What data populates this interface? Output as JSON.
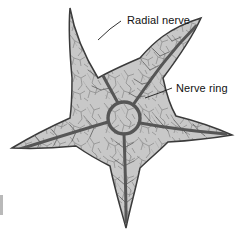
{
  "figure": {
    "background_color": "#ffffff",
    "body_fill_color": "#c8c8c8",
    "body_outline_color": "#3b3b3b",
    "nerve_color": "#565656",
    "label_color": "#111111",
    "arm_count": 5
  },
  "labels": [
    {
      "id": "radial-nerve",
      "text": "Radial nerve",
      "text_x": 127,
      "text_y": 24,
      "leader_points": "121,21 110,29 98,40",
      "anchor": "start"
    },
    {
      "id": "nerve-ring",
      "text": "Nerve ring",
      "text_x": 176,
      "text_y": 92,
      "leader_points": "172,88 159,93 145,98",
      "anchor": "start"
    }
  ],
  "structures": {
    "nerve_ring": {
      "name": "Nerve ring",
      "center_x": 124,
      "center_y": 118,
      "radius": 16
    },
    "radial_nerves": [
      {
        "name": "radial-nerve-upper-left",
        "tip_x": 72,
        "tip_y": 16
      },
      {
        "name": "radial-nerve-upper-right",
        "tip_x": 196,
        "tip_y": 26
      },
      {
        "name": "radial-nerve-right",
        "tip_x": 226,
        "tip_y": 134
      },
      {
        "name": "radial-nerve-bottom",
        "tip_x": 126,
        "tip_y": 222
      },
      {
        "name": "radial-nerve-left",
        "tip_x": 20,
        "tip_y": 149
      }
    ],
    "arm_tips": [
      {
        "name": "arm-tip-upper-left",
        "x": 70,
        "y": 8
      },
      {
        "name": "arm-tip-upper-right",
        "x": 201,
        "y": 18
      },
      {
        "name": "arm-tip-right",
        "x": 232,
        "y": 135
      },
      {
        "name": "arm-tip-bottom",
        "x": 126,
        "y": 228
      },
      {
        "name": "arm-tip-left",
        "x": 12,
        "y": 148
      }
    ],
    "edge_mark": {
      "x": 0,
      "y": 195,
      "width": 3,
      "height": 20
    }
  }
}
